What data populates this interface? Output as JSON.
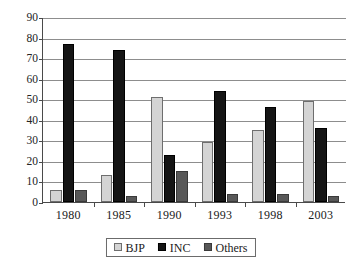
{
  "chart_data": {
    "type": "bar",
    "title": "",
    "subtitle": "",
    "xlabel": "",
    "ylabel": "",
    "categories": [
      "1980",
      "1985",
      "1990",
      "1993",
      "1998",
      "2003"
    ],
    "series": [
      {
        "name": "BJP",
        "color": "#d4d4d4",
        "values": [
          6,
          13,
          51,
          29,
          35,
          49
        ]
      },
      {
        "name": "INC",
        "color": "#151515",
        "values": [
          77,
          74,
          23,
          54,
          46,
          36
        ]
      },
      {
        "name": "Others",
        "color": "#585858",
        "values": [
          6,
          3,
          15,
          4,
          4,
          3
        ]
      }
    ],
    "ylim": [
      0,
      90
    ],
    "ytick_step": 10,
    "yticks": [
      "0",
      "10",
      "20",
      "30",
      "40",
      "50",
      "60",
      "70",
      "80",
      "90"
    ],
    "grid": true,
    "legend_position": "bottom-center",
    "legend_entries": [
      "BJP",
      "INC",
      "Others"
    ]
  },
  "legend": {
    "items": [
      {
        "label": "BJP"
      },
      {
        "label": "INC"
      },
      {
        "label": "Others"
      }
    ]
  }
}
